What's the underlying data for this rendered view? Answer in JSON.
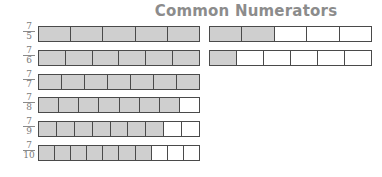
{
  "title": "Common Numerators",
  "colors": {
    "filled": "#cfcfcf",
    "empty": "#ffffff",
    "border": "#4a4a4a",
    "title": "#8c8c8c"
  },
  "rows": [
    {
      "numerator": "7",
      "denominator": "5",
      "strips": [
        {
          "parts": 5,
          "filled": 5
        },
        {
          "parts": 5,
          "filled": 2
        }
      ]
    },
    {
      "numerator": "7",
      "denominator": "6",
      "strips": [
        {
          "parts": 6,
          "filled": 6
        },
        {
          "parts": 6,
          "filled": 1
        }
      ]
    },
    {
      "numerator": "7",
      "denominator": "7",
      "strips": [
        {
          "parts": 7,
          "filled": 7
        }
      ]
    },
    {
      "numerator": "7",
      "denominator": "8",
      "strips": [
        {
          "parts": 8,
          "filled": 7
        }
      ]
    },
    {
      "numerator": "7",
      "denominator": "9",
      "strips": [
        {
          "parts": 9,
          "filled": 7
        }
      ]
    },
    {
      "numerator": "7",
      "denominator": "10",
      "strips": [
        {
          "parts": 10,
          "filled": 7
        }
      ]
    }
  ]
}
